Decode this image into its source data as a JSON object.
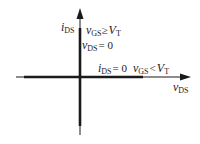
{
  "diagram": {
    "type": "ideal switch i-v characteristic",
    "axes": {
      "x": {
        "var": "v",
        "sub": "DS"
      },
      "y": {
        "var": "i",
        "sub": "DS"
      }
    },
    "on_region": {
      "l1": {
        "var": "v",
        "sub": "GS",
        "op": "≥",
        "rhs": "V",
        "rhs_sub": "T"
      },
      "l2": {
        "var": "v",
        "sub": "DS",
        "op": "= 0"
      }
    },
    "off_region": {
      "l1": {
        "var": "i",
        "sub": "DS",
        "op": "= 0"
      },
      "l2": {
        "var": "v",
        "sub": "GS",
        "op": "<",
        "rhs": "V",
        "rhs_sub": "T"
      }
    },
    "colors": {
      "axis": "#1a1a1a",
      "background": "#ffffff"
    }
  }
}
